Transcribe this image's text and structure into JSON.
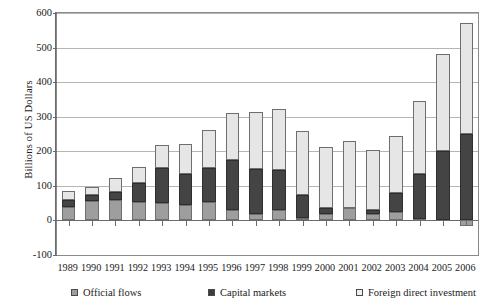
{
  "chart_data": {
    "type": "bar",
    "stacked": true,
    "title": "",
    "xlabel": "",
    "ylabel": "Billions of US Dollars",
    "ylim": [
      -100,
      600
    ],
    "yticks": [
      -100,
      0,
      100,
      200,
      300,
      400,
      500,
      600
    ],
    "ytick_labels": [
      "-100",
      "0",
      "100",
      "200",
      "300",
      "400",
      "500",
      "600"
    ],
    "grid": true,
    "legend_position": "bottom",
    "categories": [
      "1989",
      "1990",
      "1991",
      "1992",
      "1993",
      "1994",
      "1995",
      "1996",
      "1997",
      "1998",
      "1999",
      "2000",
      "2001",
      "2002",
      "2003",
      "2004",
      "2005",
      "2006"
    ],
    "series": [
      {
        "name": "Official flows",
        "color": "#9e9e9e",
        "values": [
          40,
          57,
          58,
          53,
          50,
          45,
          53,
          30,
          20,
          30,
          8,
          18,
          35,
          20,
          25,
          5,
          0,
          -15
        ]
      },
      {
        "name": "Capital markets",
        "color": "#444444",
        "values": [
          20,
          17,
          25,
          55,
          102,
          88,
          100,
          145,
          130,
          115,
          65,
          18,
          0,
          10,
          55,
          130,
          200,
          250
        ]
      },
      {
        "name": "Foreign direct investment",
        "color": "#e6e6e6",
        "values": [
          25,
          23,
          40,
          47,
          67,
          88,
          108,
          135,
          165,
          178,
          185,
          177,
          195,
          175,
          165,
          210,
          280,
          320
        ]
      }
    ],
    "totals": [
      85,
      97,
      123,
      155,
      219,
      221,
      261,
      310,
      315,
      323,
      258,
      213,
      230,
      205,
      245,
      345,
      480,
      555
    ]
  },
  "legend": {
    "items": [
      {
        "label": "Official flows",
        "swatch": "official-flows-swatch"
      },
      {
        "label": "Capital markets",
        "swatch": "capital-markets-swatch"
      },
      {
        "label": "Foreign direct investment",
        "swatch": "foreign-direct-investment-swatch"
      }
    ]
  }
}
